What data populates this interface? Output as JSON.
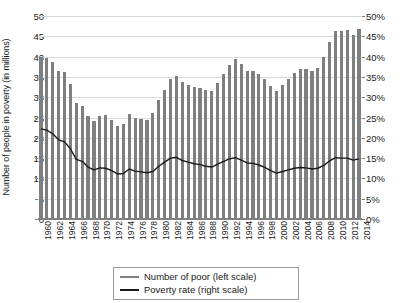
{
  "chart_data": {
    "type": "bar",
    "title": "",
    "xlabel": "",
    "ylabel": "Number of people in poverty (in millions)",
    "ylabel_right": "",
    "ylim": [
      0,
      50
    ],
    "ylim_right": [
      0,
      50
    ],
    "ytick_labels": [
      "0",
      "5",
      "10",
      "15",
      "20",
      "25",
      "30",
      "35",
      "40",
      "45",
      "50"
    ],
    "ytick_values": [
      0,
      5,
      10,
      15,
      20,
      25,
      30,
      35,
      40,
      45,
      50
    ],
    "ytick_right_labels": [
      "0%",
      "5%",
      "10%",
      "15%",
      "20%",
      "25%",
      "30%",
      "35%",
      "40%",
      "45%",
      "50%"
    ],
    "ytick_right_values": [
      0,
      5,
      10,
      15,
      20,
      25,
      30,
      35,
      40,
      45,
      50
    ],
    "grid": true,
    "legend_position": "bottom-center",
    "x": [
      1960,
      1961,
      1962,
      1963,
      1964,
      1965,
      1966,
      1967,
      1968,
      1969,
      1970,
      1971,
      1972,
      1973,
      1974,
      1975,
      1976,
      1977,
      1978,
      1979,
      1980,
      1981,
      1982,
      1983,
      1984,
      1985,
      1986,
      1987,
      1988,
      1989,
      1990,
      1991,
      1992,
      1993,
      1994,
      1995,
      1996,
      1997,
      1998,
      1999,
      2000,
      2001,
      2002,
      2003,
      2004,
      2005,
      2006,
      2007,
      2008,
      2009,
      2010,
      2011,
      2012,
      2013,
      2014
    ],
    "xtick_labels": [
      "1960",
      "1962",
      "1964",
      "1966",
      "1968",
      "1970",
      "1972",
      "1974",
      "1976",
      "1978",
      "1980",
      "1982",
      "1984",
      "1986",
      "1988",
      "1990",
      "1992",
      "1994",
      "1996",
      "1998",
      "2000",
      "2002",
      "2004",
      "2006",
      "2008",
      "2010",
      "2012",
      "2014"
    ],
    "series": [
      {
        "name": "Number of poor (left scale)",
        "axis": "left",
        "render": "bar",
        "color": "#7f7f7f",
        "values": [
          39.9,
          39.6,
          38.6,
          36.4,
          36.1,
          33.2,
          28.5,
          27.8,
          25.4,
          24.1,
          25.4,
          25.6,
          24.5,
          23.0,
          23.4,
          25.9,
          25.0,
          24.7,
          24.5,
          26.1,
          29.3,
          31.8,
          34.4,
          35.3,
          33.7,
          33.1,
          32.4,
          32.2,
          31.7,
          31.5,
          33.6,
          35.7,
          38.0,
          39.3,
          38.1,
          36.4,
          36.5,
          35.6,
          34.5,
          32.8,
          31.6,
          32.9,
          34.6,
          35.9,
          37.0,
          37.0,
          36.5,
          37.3,
          39.8,
          43.6,
          46.3,
          46.2,
          46.5,
          45.3,
          46.7
        ]
      },
      {
        "name": "Poverty rate (right scale)",
        "axis": "right",
        "render": "line",
        "color": "#1a1a1a",
        "values": [
          22.2,
          21.9,
          21.0,
          19.5,
          19.0,
          17.3,
          14.7,
          14.2,
          12.8,
          12.1,
          12.6,
          12.5,
          11.9,
          11.1,
          11.2,
          12.3,
          11.8,
          11.6,
          11.4,
          11.7,
          13.0,
          14.0,
          15.0,
          15.2,
          14.4,
          14.0,
          13.6,
          13.4,
          13.0,
          12.8,
          13.5,
          14.2,
          14.8,
          15.1,
          14.5,
          13.8,
          13.7,
          13.3,
          12.7,
          11.9,
          11.3,
          11.7,
          12.1,
          12.5,
          12.7,
          12.6,
          12.3,
          12.5,
          13.2,
          14.3,
          15.1,
          15.0,
          15.0,
          14.5,
          14.8
        ]
      }
    ]
  },
  "legend": {
    "items": [
      {
        "label": "Number of poor (left scale)",
        "color": "#808080"
      },
      {
        "label": "Poverty rate (right scale)",
        "color": "#1a1a1a"
      }
    ]
  },
  "colors": {
    "bar": "#7f7f7f",
    "line": "#1a1a1a",
    "grid": "#d9d9d9",
    "axis": "#808080",
    "background": "#ffffff"
  }
}
